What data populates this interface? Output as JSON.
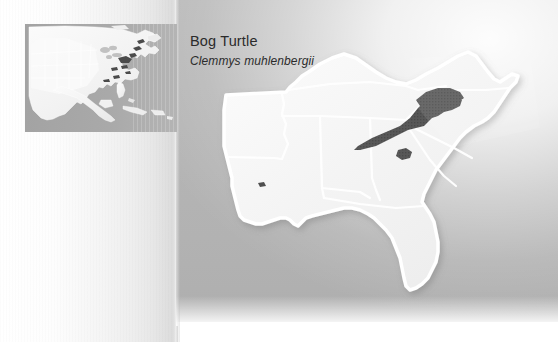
{
  "figure": {
    "kind": "species-range-map",
    "title": "Bog Turtle",
    "scientific_name": "Clemmys muhlenbergii"
  },
  "colors": {
    "panel_grey": "#b5b5b5",
    "land_fill": "#f2f2f2",
    "land_outline": "#ffffff",
    "range_fill": "#565656",
    "inset_ocean": "#a8a8a8",
    "inset_land": "#f4f4f4",
    "text": "#2b2b2b"
  },
  "inset_map": {
    "name": "north-america-locator",
    "ocean_label": "",
    "region": "North America",
    "range_patches": 9
  },
  "main_map": {
    "name": "southeastern-united-states",
    "states": [
      "Arkansas",
      "Louisiana",
      "Mississippi",
      "Alabama",
      "Tennessee",
      "Kentucky",
      "Georgia",
      "Florida",
      "South Carolina",
      "North Carolina",
      "Virginia"
    ],
    "range_patches": [
      {
        "label": "Appalachian range band",
        "region": "eastern Tennessee / western North Carolina / Virginia"
      },
      {
        "label": "outlier patch",
        "region": "western North Carolina"
      },
      {
        "label": "outlier spot",
        "region": "Louisiana"
      }
    ]
  }
}
